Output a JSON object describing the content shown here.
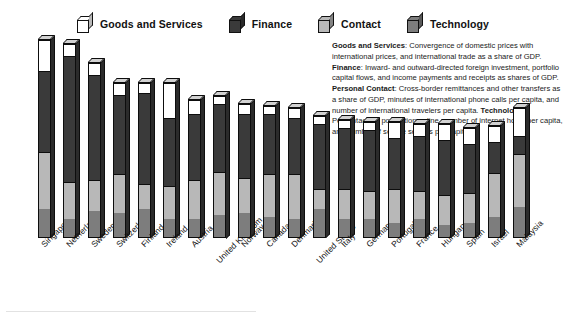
{
  "legend": {
    "items": [
      {
        "label": "Goods and Services",
        "color": "#ffffff",
        "icon": "cube-icon"
      },
      {
        "label": "Finance",
        "color": "#3a3a3a",
        "icon": "cube-icon"
      },
      {
        "label": "Contact",
        "color": "#b8b8b8",
        "icon": "cube-icon"
      },
      {
        "label": "Technology",
        "color": "#7d7d7d",
        "icon": "cube-icon"
      }
    ]
  },
  "description": {
    "parts": [
      {
        "bold": true,
        "text": "Goods and Services"
      },
      {
        "bold": false,
        "text": ": Convergence of domestic prices with international prices, and international trade as a share of GDP. "
      },
      {
        "bold": true,
        "text": "Finance"
      },
      {
        "bold": false,
        "text": ": Inward- and outward-directed foreign investment, portfolio capital flows, and income payments and receipts as shares of GDP. "
      },
      {
        "bold": true,
        "text": "Personal Contact"
      },
      {
        "bold": false,
        "text": ": Cross-border remittances and other transfers as a share of GDP, minutes of international phone calls per capita, and number of international travelers per capita. "
      },
      {
        "bold": true,
        "text": "Technology"
      },
      {
        "bold": false,
        "text": ": Percentage of population online, number of internet hosts per capita, and number of secure servers per capita."
      }
    ]
  },
  "chart_data": {
    "type": "bar",
    "stacked": true,
    "title": "",
    "subtitle": "",
    "xlabel": "",
    "ylabel": "",
    "grid": false,
    "legend_position": "top",
    "ylim": [
      0,
      100
    ],
    "categories": [
      "Singapore",
      "Netherlands",
      "Sweden",
      "Switzerland",
      "Finland",
      "Ireland",
      "Austria",
      "United Kingdom",
      "Norway",
      "Canada",
      "Denmark",
      "United States",
      "Italy",
      "Germany",
      "Portugal",
      "France",
      "Hungary",
      "Spain",
      "Israel",
      "Malaysia"
    ],
    "series": [
      {
        "name": "Technology",
        "color": "#7d7d7d",
        "values": [
          14,
          9,
          13,
          12,
          14,
          9,
          9,
          11,
          12,
          10,
          9,
          14,
          9,
          9,
          7,
          9,
          6,
          7,
          10,
          15
        ]
      },
      {
        "name": "Contact",
        "color": "#b8b8b8",
        "values": [
          28,
          18,
          15,
          19,
          12,
          16,
          19,
          21,
          17,
          21,
          22,
          10,
          15,
          14,
          17,
          14,
          15,
          15,
          22,
          26
        ]
      },
      {
        "name": "Finance",
        "color": "#3a3a3a",
        "values": [
          40,
          62,
          52,
          39,
          45,
          34,
          33,
          34,
          32,
          30,
          28,
          32,
          30,
          30,
          25,
          27,
          27,
          24,
          15,
          9
        ]
      },
      {
        "name": "Goods and Services",
        "color": "#ffffff",
        "values": [
          15,
          6,
          6,
          6,
          5,
          17,
          7,
          4,
          5,
          4,
          5,
          4,
          4,
          4,
          8,
          6,
          8,
          8,
          8,
          14
        ]
      }
    ]
  }
}
